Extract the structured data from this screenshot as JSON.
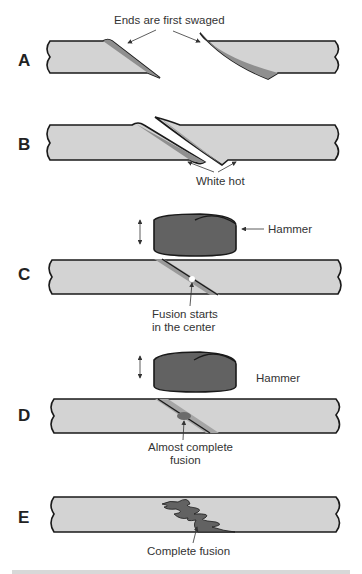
{
  "figure": {
    "colors": {
      "rod_fill": "#d3d3d3",
      "bevel_fill": "#8f8f8f",
      "hammer_fill": "#626262",
      "outline": "#1a1a1a",
      "text": "#333333"
    },
    "panels": [
      {
        "label": "A",
        "annotations": [
          "Ends are first swaged"
        ]
      },
      {
        "label": "B",
        "annotations": [
          "White hot"
        ]
      },
      {
        "label": "C",
        "annotations": [
          "Hammer",
          "Fusion starts",
          "in the center"
        ]
      },
      {
        "label": "D",
        "annotations": [
          "Hammer",
          "Almost complete",
          "fusion"
        ]
      },
      {
        "label": "E",
        "annotations": [
          "Complete fusion"
        ]
      }
    ]
  }
}
